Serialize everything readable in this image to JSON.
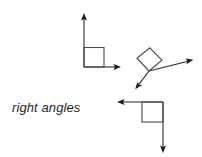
{
  "figure": {
    "caption": "right angles",
    "background_color": "#ffffff",
    "stroke_color": "#2b2b2b",
    "square_stroke_color": "#4a4a4a",
    "arrow_fill_color": "#1a1a1a",
    "angles": [
      {
        "name": "upper-left-right-angle",
        "orientation": "standard",
        "vertex": [
          84,
          67
        ],
        "rays": [
          {
            "name": "vertical-ray-up",
            "from": [
              84,
              67
            ],
            "to": [
              84,
              14
            ],
            "arrow": "up"
          },
          {
            "name": "horizontal-ray-right",
            "from": [
              84,
              67
            ],
            "to": [
              121,
              67
            ],
            "arrow": "right"
          }
        ],
        "square_marker": {
          "x": 84,
          "y": 48,
          "size": 20
        },
        "measure_degrees": 90
      },
      {
        "name": "rotated-right-angle",
        "orientation": "rotated",
        "vertex": [
          149,
          71
        ],
        "rays": [
          {
            "name": "ray-upper-right",
            "from": [
              149,
              71
            ],
            "to": [
              193,
              60
            ],
            "arrow": "right"
          },
          {
            "name": "ray-lower-left",
            "from": [
              149,
              71
            ],
            "to": [
              136,
              88
            ],
            "arrow": "down-left"
          }
        ],
        "square_marker_points": "137,58 150,48 162,60 149,71",
        "measure_degrees": 90
      },
      {
        "name": "lower-right-right-angle",
        "orientation": "flipped",
        "vertex": [
          163,
          102
        ],
        "rays": [
          {
            "name": "horizontal-ray-left",
            "from": [
              163,
              102
            ],
            "to": [
              117,
              102
            ],
            "arrow": "left"
          },
          {
            "name": "vertical-ray-down",
            "from": [
              163,
              102
            ],
            "to": [
              163,
              153
            ],
            "arrow": "down"
          }
        ],
        "square_marker": {
          "x": 142,
          "y": 102,
          "size": 21
        },
        "measure_degrees": 90
      }
    ]
  }
}
